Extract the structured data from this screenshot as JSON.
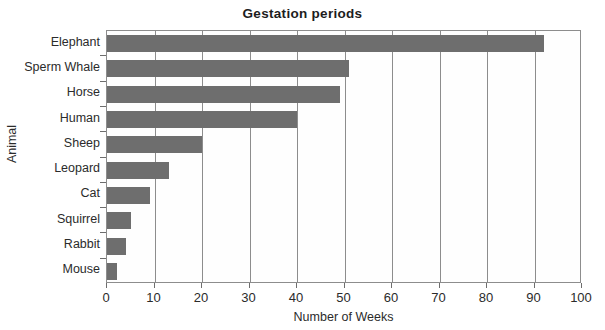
{
  "chart_data": {
    "type": "bar",
    "orientation": "horizontal",
    "title": "Gestation periods",
    "xlabel": "Number of Weeks",
    "ylabel": "Animal",
    "categories": [
      "Elephant",
      "Sperm Whale",
      "Horse",
      "Human",
      "Sheep",
      "Leopard",
      "Cat",
      "Squirrel",
      "Rabbit",
      "Mouse"
    ],
    "values": [
      92,
      51,
      49,
      40,
      20,
      13,
      9,
      5,
      4,
      2
    ],
    "xlim": [
      0,
      100
    ],
    "xticks": [
      0,
      10,
      20,
      30,
      40,
      50,
      60,
      70,
      80,
      90,
      100
    ],
    "xtick_labels": [
      "0",
      "10",
      "20",
      "30",
      "40",
      "50",
      "60",
      "70",
      "80",
      "90",
      "100"
    ],
    "grid": "vertical",
    "legend": "none",
    "bar_color": "#6e6e6e",
    "frame_color": "#8d8d8d",
    "background": "#ffffff"
  }
}
